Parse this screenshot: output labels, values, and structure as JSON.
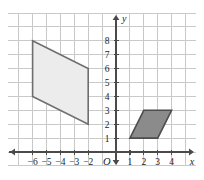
{
  "figure": {
    "title": "",
    "origin_label": "O",
    "x_axis_label": "x",
    "y_axis_label": "y"
  },
  "chart_data": {
    "type": "scatter",
    "title": "",
    "xlabel": "x",
    "ylabel": "y",
    "grid": true,
    "legend": "none",
    "xlim": [
      -7.7,
      5.7
    ],
    "ylim": [
      -0.9,
      9.0
    ],
    "xticks": [
      -6,
      -5,
      -4,
      -3,
      -2,
      1,
      2,
      3,
      4
    ],
    "yticks": [
      1,
      2,
      3,
      4,
      5,
      6,
      7,
      8
    ],
    "xtick_labels": [
      "-6",
      "-5",
      "-4",
      "-3",
      "-2",
      "1",
      "2",
      "3",
      "4"
    ],
    "ytick_labels": [
      "1",
      "2",
      "3",
      "4",
      "5",
      "6",
      "7",
      "8"
    ],
    "origin_label": "O",
    "grid_color": "#c9c9c9",
    "axis_color": "#4a4a4a",
    "shapes": [
      {
        "name": "large-parallelogram",
        "kind": "parallelogram",
        "vertices": [
          [
            -6,
            8
          ],
          [
            -2,
            6
          ],
          [
            -2,
            2
          ],
          [
            -6,
            4
          ]
        ],
        "fill": "#ececec",
        "stroke": "#6e6e6e"
      },
      {
        "name": "small-parallelogram",
        "kind": "parallelogram",
        "vertices": [
          [
            1,
            1
          ],
          [
            3,
            1
          ],
          [
            4,
            3
          ],
          [
            2,
            3
          ]
        ],
        "fill": "#8b8b8b",
        "stroke": "#4d4d4d"
      }
    ]
  }
}
